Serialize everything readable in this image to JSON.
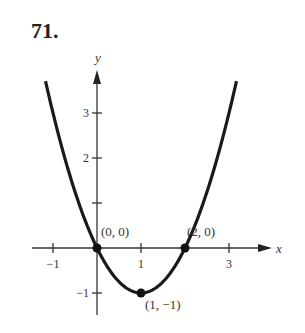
{
  "problem_number": "71.",
  "chart_data": {
    "type": "line",
    "title": "",
    "function": "y = x^2 - 2x",
    "xlabel": "x",
    "ylabel": "y",
    "xlim": [
      -1.5,
      4
    ],
    "ylim": [
      -1.4,
      4
    ],
    "x_ticks": [
      {
        "value": -1,
        "label": "−1"
      },
      {
        "value": 1,
        "label": "1"
      },
      {
        "value": 3,
        "label": "3"
      }
    ],
    "y_ticks": [
      {
        "value": -1,
        "label": "−1"
      },
      {
        "value": 1,
        "label": ""
      },
      {
        "value": 2,
        "label": "2"
      },
      {
        "value": 3,
        "label": "3"
      }
    ],
    "grid": false,
    "curve_x_range": [
      -1.17,
      3.17
    ],
    "points": [
      {
        "x": 0,
        "y": 0,
        "label": "(0, 0)"
      },
      {
        "x": 2,
        "y": 0,
        "label": "(2, 0)"
      },
      {
        "x": 1,
        "y": -1,
        "label": "(1, −1)"
      }
    ]
  }
}
